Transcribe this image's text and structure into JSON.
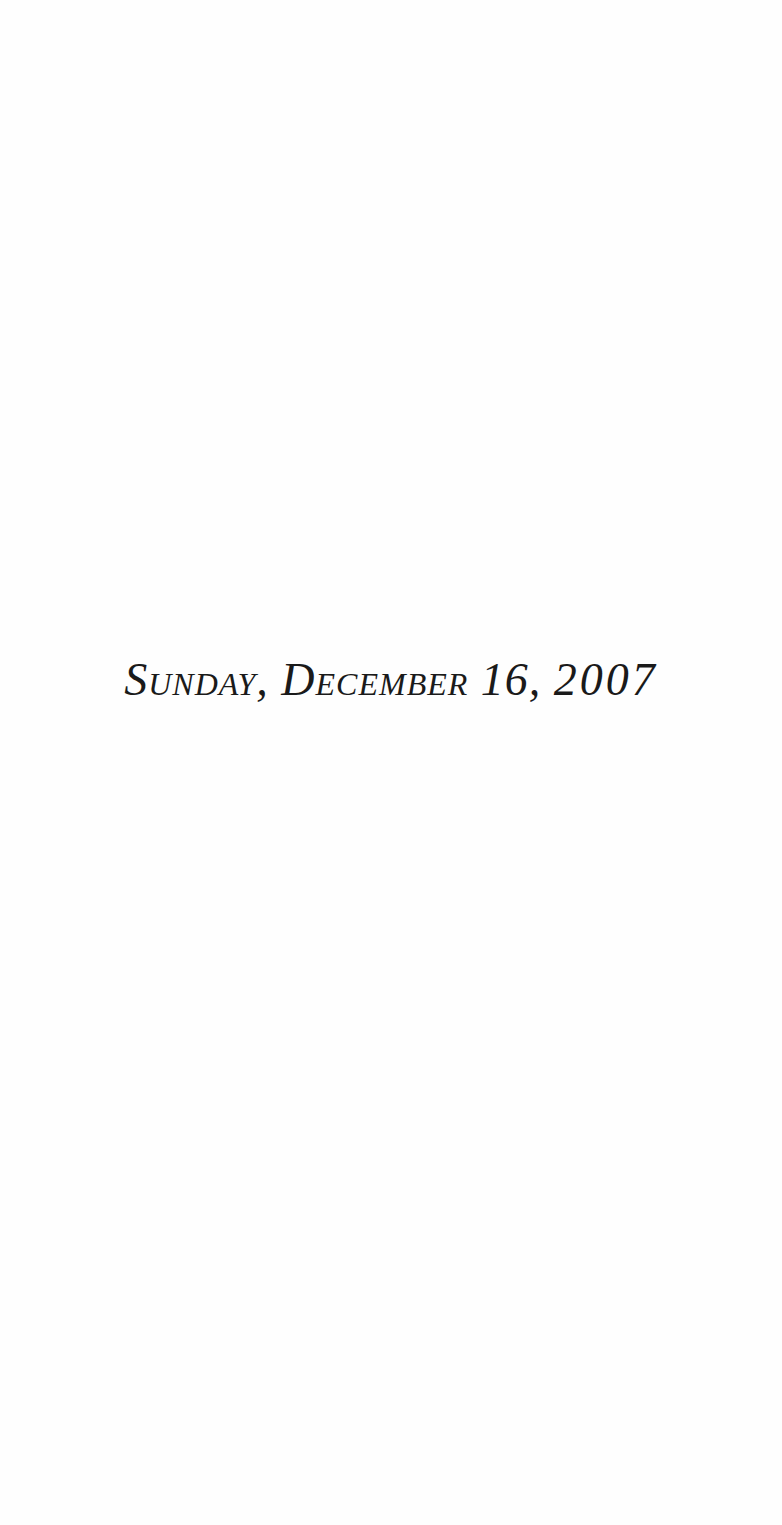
{
  "page": {
    "background_color": "#fefefe",
    "text_color": "#1a1a1a"
  },
  "heading": {
    "weekday": "Sunday,",
    "month_day": "December 16,",
    "year": "2007",
    "full_text": "Sunday, December 16, 2007"
  }
}
